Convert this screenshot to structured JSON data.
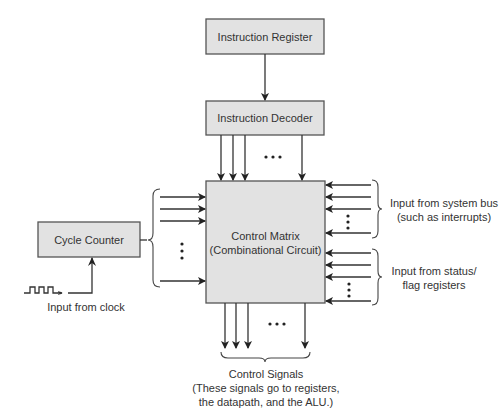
{
  "diagram": {
    "colors": {
      "box_fill": "#e2e2e2",
      "box_stroke": "#555555",
      "line": "#333333",
      "text": "#333333"
    },
    "nodes": {
      "instruction_register": {
        "label": "Instruction Register"
      },
      "instruction_decoder": {
        "label": "Instruction Decoder"
      },
      "control_matrix": {
        "line1": "Control Matrix",
        "line2": "(Combinational Circuit)"
      },
      "cycle_counter": {
        "label": "Cycle Counter"
      }
    },
    "annotations": {
      "clock_input": "Input from clock",
      "system_bus_line1": "Input from system bus",
      "system_bus_line2": "(such as interrupts)",
      "status_line1": "Input from status/",
      "status_line2": "flag registers",
      "control_signals_line1": "Control Signals",
      "control_signals_line2": "(These signals go to registers,",
      "control_signals_line3": "the datapath, and the ALU.)"
    },
    "edges": [
      {
        "from": "instruction_register",
        "to": "instruction_decoder"
      },
      {
        "from": "instruction_decoder",
        "to": "control_matrix",
        "count": "many"
      },
      {
        "from": "cycle_counter",
        "to": "control_matrix",
        "count": "many"
      },
      {
        "from": "clock",
        "to": "cycle_counter"
      },
      {
        "from": "system_bus",
        "to": "control_matrix",
        "count": "many"
      },
      {
        "from": "status_flag_registers",
        "to": "control_matrix",
        "count": "many"
      },
      {
        "from": "control_matrix",
        "to": "control_signals",
        "count": "many"
      }
    ]
  }
}
